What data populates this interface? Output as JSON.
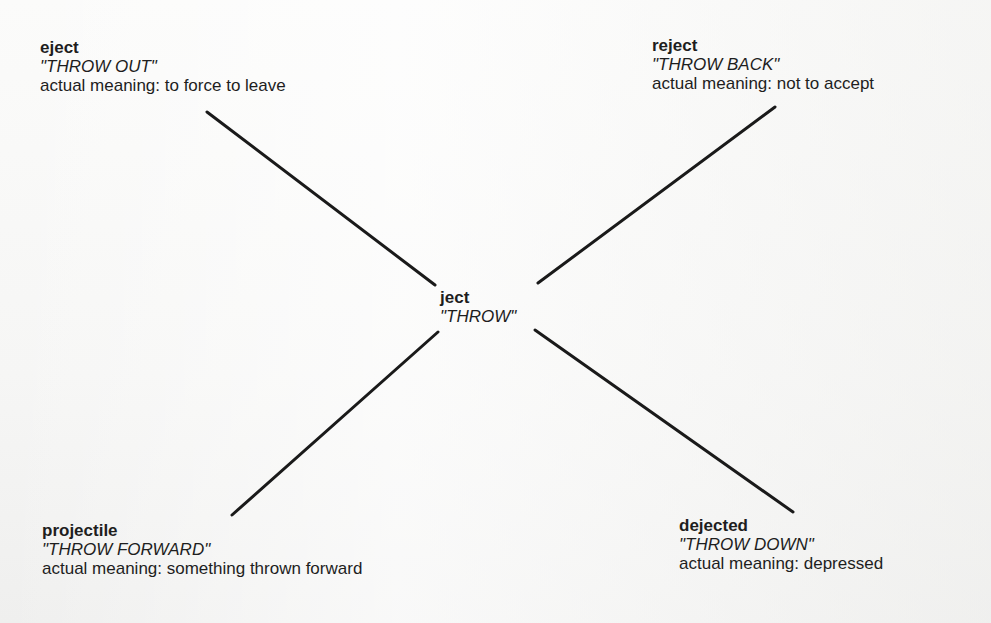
{
  "diagram": {
    "center": {
      "word": "ject",
      "literal": "\"THROW\""
    },
    "nodes": [
      {
        "id": "eject",
        "word": "eject",
        "literal": "\"THROW OUT\"",
        "meaning": "actual meaning: to force to leave"
      },
      {
        "id": "reject",
        "word": "reject",
        "literal": "\"THROW BACK\"",
        "meaning": "actual meaning: not to accept"
      },
      {
        "id": "projectile",
        "word": "projectile",
        "literal": "\"THROW FORWARD\"",
        "meaning": "actual meaning: something thrown forward"
      },
      {
        "id": "dejected",
        "word": "dejected",
        "literal": "\"THROW DOWN\"",
        "meaning": "actual meaning: depressed"
      }
    ],
    "edges": [
      {
        "from": "ject",
        "to": "eject"
      },
      {
        "from": "ject",
        "to": "reject"
      },
      {
        "from": "ject",
        "to": "projectile"
      },
      {
        "from": "ject",
        "to": "dejected"
      }
    ],
    "colors": {
      "line": "#1a1a1a",
      "text": "#1e1e1e",
      "background": "#f8f8f7"
    }
  }
}
